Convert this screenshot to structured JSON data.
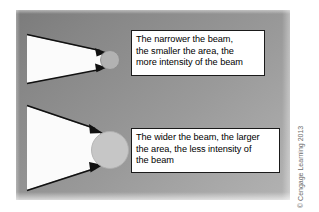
{
  "figure": {
    "title_alt": "Beam width versus intensity diagram",
    "background_panel_color": "#909090",
    "beam_fill_color": "#fbfbfb",
    "outline_color": "#111111",
    "callout_bg_color": "#ffffff",
    "callout_border_color": "#1a1a1a"
  },
  "callouts": [
    {
      "id": "narrow-beam-callout",
      "lines": [
        "The narrower the beam,",
        "the smaller the area, the",
        "more intensity of the beam"
      ]
    },
    {
      "id": "wide-beam-callout",
      "lines": [
        "The wider the beam, the larger",
        "the area, the less intensity of",
        "the beam"
      ]
    }
  ],
  "beams": [
    {
      "id": "narrow-beam",
      "label": "narrow beam wedge",
      "spot_label": "small irradiated area",
      "spot_fill": "#b0b0b0"
    },
    {
      "id": "wide-beam",
      "label": "wide beam wedge",
      "spot_label": "large irradiated area",
      "spot_fill": "#c4c4c4"
    }
  ],
  "credit": {
    "text": "© Cengage Learning 2013",
    "color": "#6b6b6b"
  }
}
